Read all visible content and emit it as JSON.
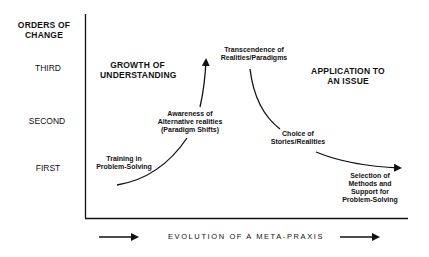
{
  "diagram": {
    "y_axis": {
      "title_line1": "ORDERS OF",
      "title_line2": "CHANGE",
      "levels": [
        "THIRD",
        "SECOND",
        "FIRST"
      ]
    },
    "regions": {
      "left": {
        "line1": "GROWTH OF",
        "line2": "UNDERSTANDING"
      },
      "right": {
        "line1": "APPLICATION TO",
        "line2": "AN ISSUE"
      }
    },
    "nodes": {
      "training": {
        "line1": "Training in",
        "line2": "Problem-Solving"
      },
      "awareness": {
        "line1": "Awareness of",
        "line2": "Alternative realities",
        "line3": "(Paradigm Shifts)"
      },
      "transcendence": {
        "line1": "Transcendence of",
        "line2": "Realities/Paradigms"
      },
      "choice": {
        "line1": "Choice of",
        "line2": "Stories/Realities"
      },
      "selection": {
        "line1": "Selection of",
        "line2": "Methods and",
        "line3": "Support for",
        "line4": "Problem-Solving"
      }
    },
    "x_axis": {
      "caption": "EVOLUTION OF A META-PRAXIS"
    },
    "colors": {
      "ink": "#111111",
      "background": "#ffffff"
    }
  }
}
